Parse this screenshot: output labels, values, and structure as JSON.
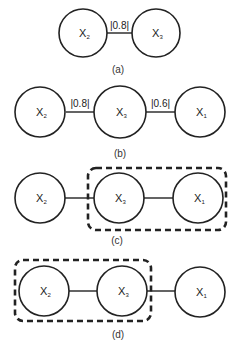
{
  "diagram": {
    "colors": {
      "stroke": "#222222",
      "background": "#ffffff"
    },
    "panels": [
      {
        "id": "a",
        "label": "(a)",
        "nodes": [
          {
            "name": "X",
            "sub": "2"
          },
          {
            "name": "X",
            "sub": "3"
          }
        ],
        "edges": [
          {
            "from": "X2",
            "to": "X3",
            "label": "|0.8|"
          }
        ]
      },
      {
        "id": "b",
        "label": "(b)",
        "nodes": [
          {
            "name": "X",
            "sub": "2"
          },
          {
            "name": "X",
            "sub": "3"
          },
          {
            "name": "X",
            "sub": "1"
          }
        ],
        "edges": [
          {
            "from": "X2",
            "to": "X3",
            "label": "|0.8|"
          },
          {
            "from": "X3",
            "to": "X1",
            "label": "|0.6|"
          }
        ]
      },
      {
        "id": "c",
        "label": "(c)",
        "nodes": [
          {
            "name": "X",
            "sub": "2"
          },
          {
            "name": "X",
            "sub": "3"
          },
          {
            "name": "X",
            "sub": "1"
          }
        ],
        "edges": [
          {
            "from": "X2",
            "to": "X3"
          },
          {
            "from": "X3",
            "to": "X1"
          }
        ],
        "group": [
          "X3",
          "X1"
        ]
      },
      {
        "id": "d",
        "label": "(d)",
        "nodes": [
          {
            "name": "X",
            "sub": "2"
          },
          {
            "name": "X",
            "sub": "3"
          },
          {
            "name": "X",
            "sub": "1"
          }
        ],
        "edges": [
          {
            "from": "X2",
            "to": "X3"
          },
          {
            "from": "X3",
            "to": "X1"
          }
        ],
        "group": [
          "X2",
          "X3"
        ]
      }
    ]
  }
}
